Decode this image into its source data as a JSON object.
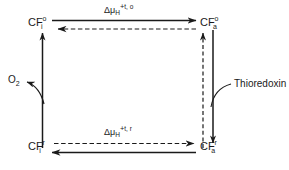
{
  "figure": {
    "background_color": "#ffffff",
    "stroke_color": "#1a1a1a",
    "width": 289,
    "height": 170
  },
  "nodes": {
    "top_left": {
      "base": "CF",
      "superscript": "o",
      "subscript": "i",
      "full": "CF i o"
    },
    "top_right": {
      "base": "CF",
      "superscript": "o",
      "subscript": "a",
      "full": "CF a o"
    },
    "bottom_left": {
      "base": "CF",
      "superscript": "r",
      "subscript": "i",
      "full": "CF i r"
    },
    "bottom_right": {
      "base": "CF",
      "superscript": "r",
      "subscript": "a",
      "full": "CF a r"
    }
  },
  "edge_labels": {
    "top": {
      "delta": "Δ",
      "mu": "μ",
      "mu_sub": "H",
      "plus": "+",
      "superscript": "t, o"
    },
    "bottom": {
      "delta": "Δ",
      "mu": "μ",
      "mu_sub": "H",
      "plus": "+",
      "superscript": "t, r"
    }
  },
  "annotations": {
    "oxygen": {
      "base": "O",
      "subscript": "2"
    },
    "thioredoxin": {
      "label": "Thioredoxin"
    }
  },
  "arrows": [
    {
      "name": "top-forward",
      "style": "solid",
      "direction": "right",
      "from": "top_left",
      "to": "top_right"
    },
    {
      "name": "top-reverse",
      "style": "dashed",
      "direction": "left",
      "from": "top_right",
      "to": "top_left"
    },
    {
      "name": "bottom-forward",
      "style": "dashed",
      "direction": "right",
      "from": "bottom_left",
      "to": "bottom_right"
    },
    {
      "name": "bottom-reverse",
      "style": "solid",
      "direction": "left",
      "from": "bottom_right",
      "to": "bottom_left"
    },
    {
      "name": "left-up",
      "style": "solid",
      "direction": "up",
      "from": "bottom_left",
      "to": "top_left"
    },
    {
      "name": "right-up",
      "style": "dashed",
      "direction": "up",
      "from": "bottom_right",
      "to": "top_right"
    },
    {
      "name": "right-down",
      "style": "solid",
      "direction": "down",
      "from": "top_right",
      "to": "bottom_right"
    },
    {
      "name": "oxygen-branch",
      "style": "solid",
      "direction": "up-left",
      "to": "oxygen"
    },
    {
      "name": "thioredoxin-branch",
      "style": "solid",
      "direction": "left",
      "to": "thioredoxin"
    }
  ]
}
